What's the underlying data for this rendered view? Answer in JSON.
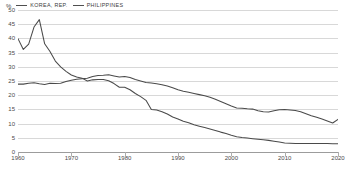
{
  "legend": {
    "unit_label": "%",
    "entries": [
      {
        "label": "KOREA, REP.",
        "color": "#4a4a4a",
        "icon": "line-swatch-icon"
      },
      {
        "label": "PHILIPPINES",
        "color": "#4a4a4a",
        "icon": "line-swatch-icon"
      }
    ]
  },
  "axes": {
    "y_ticks": [
      "50",
      "45",
      "40",
      "35",
      "30",
      "25",
      "20",
      "15",
      "10",
      "5",
      "0"
    ],
    "x_ticks": [
      "1960",
      "1970",
      "1980",
      "1990",
      "2000",
      "2010",
      "2020"
    ]
  },
  "chart_data": {
    "type": "line",
    "title": "",
    "subtitle": "",
    "xlabel": "",
    "ylabel": "%",
    "xlim": [
      1960,
      2020
    ],
    "ylim": [
      0,
      50
    ],
    "grid": true,
    "legend_position": "top-left",
    "x": [
      1960,
      1961,
      1962,
      1963,
      1964,
      1965,
      1966,
      1967,
      1968,
      1969,
      1970,
      1971,
      1972,
      1973,
      1974,
      1975,
      1976,
      1977,
      1978,
      1979,
      1980,
      1981,
      1982,
      1983,
      1984,
      1985,
      1986,
      1987,
      1988,
      1989,
      1990,
      1991,
      1992,
      1993,
      1994,
      1995,
      1996,
      1997,
      1998,
      1999,
      2000,
      2001,
      2002,
      2003,
      2004,
      2005,
      2006,
      2007,
      2008,
      2009,
      2010,
      2011,
      2012,
      2013,
      2014,
      2015,
      2016,
      2017,
      2018,
      2019,
      2020
    ],
    "series": [
      {
        "name": "KOREA, REP.",
        "color": "#4a4a4a",
        "values": [
          39.9,
          36.1,
          38.0,
          44.0,
          46.6,
          38.1,
          35.4,
          32.0,
          30.0,
          28.4,
          27.1,
          26.4,
          26.0,
          25.0,
          25.4,
          25.5,
          25.5,
          25.1,
          24.1,
          22.8,
          22.8,
          21.9,
          20.6,
          19.5,
          18.2,
          15.0,
          14.8,
          14.2,
          13.4,
          12.3,
          11.6,
          10.8,
          10.3,
          9.6,
          9.1,
          8.6,
          8.1,
          7.6,
          7.0,
          6.5,
          5.9,
          5.4,
          5.1,
          4.9,
          4.7,
          4.5,
          4.3,
          4.1,
          3.8,
          3.5,
          3.2,
          3.1,
          3.0,
          3.0,
          3.0,
          3.0,
          3.0,
          3.0,
          3.0,
          2.9,
          2.9
        ],
        "note": "Agriculture, value added (% of GDP) style series; steep decline after 1964 peak"
      },
      {
        "name": "PHILIPPINES",
        "color": "#4a4a4a",
        "values": [
          23.9,
          23.9,
          24.2,
          24.4,
          24.0,
          23.8,
          24.2,
          24.1,
          24.2,
          24.8,
          25.3,
          25.6,
          25.8,
          26.0,
          26.6,
          26.9,
          27.0,
          27.2,
          26.8,
          26.4,
          26.6,
          26.2,
          25.5,
          25.0,
          24.5,
          24.3,
          24.0,
          23.7,
          23.2,
          22.6,
          21.9,
          21.4,
          21.0,
          20.6,
          20.2,
          19.8,
          19.3,
          18.6,
          17.8,
          17.0,
          16.2,
          15.5,
          15.4,
          15.2,
          15.1,
          14.5,
          14.2,
          14.1,
          14.5,
          14.9,
          15.0,
          14.8,
          14.6,
          14.2,
          13.5,
          12.8,
          12.2,
          11.6,
          10.9,
          10.2,
          11.5
        ],
        "note": "Flat-then-declining series; crosses Korea around 1978 and ends near 11.5"
      }
    ]
  }
}
